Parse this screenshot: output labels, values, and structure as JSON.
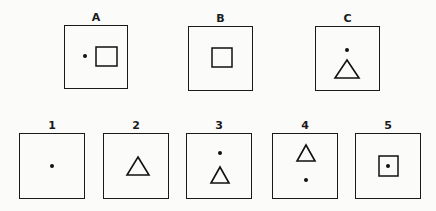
{
  "puzzle": {
    "stimuli": [
      {
        "label": "A",
        "x": 64,
        "y": 25,
        "size": 64,
        "shapes": [
          {
            "type": "dot",
            "cx": 21,
            "cy": 31
          },
          {
            "type": "square",
            "x": 32,
            "y": 22,
            "w": 21,
            "h": 19
          }
        ]
      },
      {
        "label": "B",
        "x": 188,
        "y": 26,
        "size": 65,
        "shapes": [
          {
            "type": "square",
            "x": 24,
            "y": 22,
            "w": 20,
            "h": 19
          }
        ]
      },
      {
        "label": "C",
        "x": 315,
        "y": 26,
        "size": 65,
        "shapes": [
          {
            "type": "dot",
            "cx": 32,
            "cy": 24
          },
          {
            "type": "triangle",
            "cx": 32,
            "top": 34,
            "w": 24,
            "h": 18
          }
        ]
      }
    ],
    "options": [
      {
        "label": "1",
        "x": 19,
        "y": 133,
        "size": 66,
        "shapes": [
          {
            "type": "dot",
            "cx": 33,
            "cy": 33
          }
        ]
      },
      {
        "label": "2",
        "x": 103,
        "y": 133,
        "size": 66,
        "shapes": [
          {
            "type": "triangle",
            "cx": 35,
            "top": 24,
            "w": 22,
            "h": 18
          }
        ]
      },
      {
        "label": "3",
        "x": 186,
        "y": 133,
        "size": 66,
        "shapes": [
          {
            "type": "dot",
            "cx": 34,
            "cy": 20
          },
          {
            "type": "triangle",
            "cx": 34,
            "top": 34,
            "w": 18,
            "h": 16
          }
        ]
      },
      {
        "label": "4",
        "x": 272,
        "y": 133,
        "size": 66,
        "shapes": [
          {
            "type": "triangle",
            "cx": 34,
            "top": 12,
            "w": 18,
            "h": 16
          },
          {
            "type": "dot",
            "cx": 34,
            "cy": 47
          }
        ]
      },
      {
        "label": "5",
        "x": 355,
        "y": 133,
        "size": 66,
        "shapes": [
          {
            "type": "square",
            "x": 24,
            "y": 23,
            "w": 19,
            "h": 20
          },
          {
            "type": "dot",
            "cx": 33,
            "cy": 33
          }
        ]
      }
    ]
  }
}
